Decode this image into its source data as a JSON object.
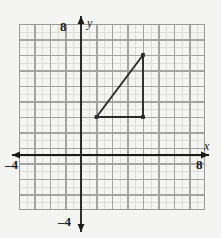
{
  "figure": {
    "type": "coordinate-graph",
    "background_color": "#f4f4f2",
    "axis_color": "#1a1a1a",
    "grid_major_color": "#9a9a9a",
    "grid_minor_color": "#c9c9c9",
    "shape_color": "#2b2b2b"
  },
  "axes": {
    "x_name": "x",
    "y_name": "y",
    "x_min_label": "–4",
    "x_max_label": "8",
    "y_min_label": "–4",
    "y_max_label": "8",
    "x_range": [
      -4,
      8
    ],
    "y_range": [
      -4,
      8
    ],
    "major_tick_step": 1,
    "minor_tick_step": 0.5,
    "grid": true,
    "arrows": [
      "x-positive",
      "x-negative",
      "y-positive",
      "y-negative"
    ]
  },
  "chart_data": {
    "type": "scatter",
    "title": "",
    "xlabel": "x",
    "ylabel": "y",
    "xlim": [
      -4,
      8
    ],
    "ylim": [
      -4,
      8
    ],
    "grid": true,
    "legend": "none",
    "shapes": [
      {
        "name": "right-triangle",
        "kind": "polygon",
        "closed": true,
        "vertices": [
          {
            "label": "A",
            "x": 1,
            "y": 2
          },
          {
            "label": "B",
            "x": 4,
            "y": 2
          },
          {
            "label": "C",
            "x": 4,
            "y": 6
          }
        ],
        "vertex_markers": true,
        "stroke": "#2b2b2b",
        "fill": "none"
      }
    ],
    "x": [
      1,
      4,
      4
    ],
    "y": [
      2,
      2,
      6
    ]
  }
}
